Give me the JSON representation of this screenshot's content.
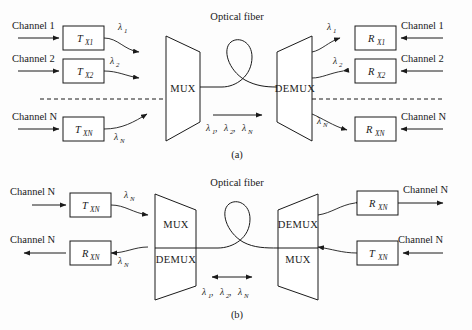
{
  "figure": {
    "background_color": "#fdfdfd",
    "line_color": "#1a1a1a",
    "panels": [
      {
        "id": "panel-a",
        "caption": "(a)",
        "fiber_label": "Optical fiber",
        "mux_label": "MUX",
        "demux_label": "DEMUX",
        "direction": "unidirectional",
        "center_wavelengths": "λ₁, λ₂, λ_N",
        "center_wavelength_parts": [
          {
            "sym": "λ",
            "sub": "1",
            "sep": ", "
          },
          {
            "sym": "λ",
            "sub": "2",
            "sep": ", "
          },
          {
            "sym": "λ",
            "sub": "N",
            "sep": ""
          }
        ],
        "left_nodes": [
          {
            "channel": "Channel 1",
            "device": "T",
            "device_sub": "X1",
            "wavelength_sym": "λ",
            "wavelength_sub": "1"
          },
          {
            "channel": "Channel 2",
            "device": "T",
            "device_sub": "X2",
            "wavelength_sym": "λ",
            "wavelength_sub": "2"
          },
          {
            "channel": "Channel N",
            "device": "T",
            "device_sub": "XN",
            "wavelength_sym": "λ",
            "wavelength_sub": "N"
          }
        ],
        "right_nodes": [
          {
            "channel": "Channel 1",
            "device": "R",
            "device_sub": "X1",
            "wavelength_sym": "λ",
            "wavelength_sub": "1"
          },
          {
            "channel": "Channel 2",
            "device": "R",
            "device_sub": "X2",
            "wavelength_sym": "λ",
            "wavelength_sub": "2"
          },
          {
            "channel": "Channel N",
            "device": "R",
            "device_sub": "XN",
            "wavelength_sym": "λ",
            "wavelength_sub": "N"
          }
        ]
      },
      {
        "id": "panel-b",
        "caption": "(b)",
        "fiber_label": "Optical fiber",
        "direction": "bidirectional",
        "center_wavelengths": "λ₁, λ₂, λ_N",
        "center_wavelength_parts": [
          {
            "sym": "λ",
            "sub": "1",
            "sep": ", "
          },
          {
            "sym": "λ",
            "sub": "2",
            "sep": ", "
          },
          {
            "sym": "λ",
            "sub": "N",
            "sep": ""
          }
        ],
        "left_unit_top_label": "MUX",
        "left_unit_bottom_label": "DEMUX",
        "right_unit_top_label": "DEMUX",
        "right_unit_bottom_label": "MUX",
        "left_nodes": [
          {
            "channel": "Channel N",
            "device": "T",
            "device_sub": "XN",
            "wavelength_sym": "λ",
            "wavelength_sub": "N"
          },
          {
            "channel": "Channel N",
            "device": "R",
            "device_sub": "XN",
            "wavelength_sym": "λ",
            "wavelength_sub": "N"
          }
        ],
        "right_nodes": [
          {
            "channel": "Channel N",
            "device": "R",
            "device_sub": "XN",
            "wavelength_sym": "λ",
            "wavelength_sub": "N"
          },
          {
            "channel": "Channel N",
            "device": "T",
            "device_sub": "XN",
            "wavelength_sym": "λ",
            "wavelength_sub": "N"
          }
        ]
      }
    ]
  }
}
